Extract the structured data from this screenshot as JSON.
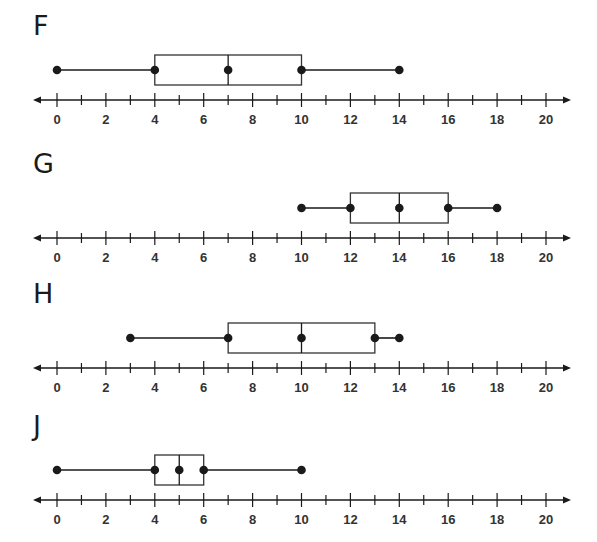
{
  "chart_data": {
    "type": "boxplot",
    "title": "",
    "xlabel": "",
    "ylabel": "",
    "xlim": [
      0,
      20
    ],
    "x_ticks_minor": [
      0,
      1,
      2,
      3,
      4,
      5,
      6,
      7,
      8,
      9,
      10,
      11,
      12,
      13,
      14,
      15,
      16,
      17,
      18,
      19,
      20
    ],
    "x_tick_labels": [
      "0",
      "2",
      "4",
      "6",
      "8",
      "10",
      "12",
      "14",
      "16",
      "18",
      "20"
    ],
    "grid": false,
    "series": [
      {
        "name": "F",
        "min": 0,
        "q1": 4,
        "median": 7,
        "q3": 10,
        "max": 14
      },
      {
        "name": "G",
        "min": 10,
        "q1": 12,
        "median": 14,
        "q3": 16,
        "max": 18
      },
      {
        "name": "H",
        "min": 3,
        "q1": 7,
        "median": 10,
        "q3": 13,
        "max": 14
      },
      {
        "name": "J",
        "min": 0,
        "q1": 4,
        "median": 5,
        "q3": 6,
        "max": 10
      }
    ]
  },
  "panels": [
    {
      "label": "F",
      "top": 0
    },
    {
      "label": "G",
      "top": 138
    },
    {
      "label": "H",
      "top": 268
    },
    {
      "label": "J",
      "top": 400
    }
  ],
  "colors": {
    "ink": "#1a1a1a",
    "box_stroke": "#333333"
  }
}
